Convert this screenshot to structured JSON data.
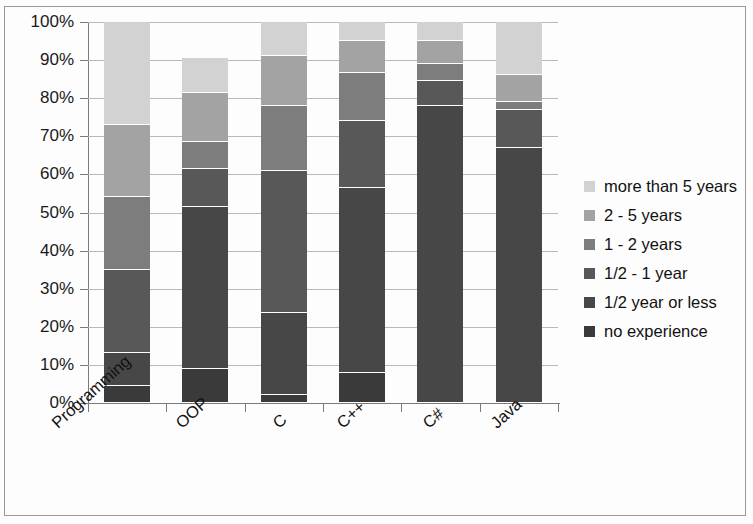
{
  "chart_data": {
    "type": "bar",
    "subtype": "stacked-100-percent",
    "title": "",
    "xlabel": "",
    "ylabel": "",
    "ylim": [
      0,
      100
    ],
    "ytick_labels": [
      "0%",
      "10%",
      "20%",
      "30%",
      "40%",
      "50%",
      "60%",
      "70%",
      "80%",
      "90%",
      "100%"
    ],
    "ytick_values": [
      0,
      10,
      20,
      30,
      40,
      50,
      60,
      70,
      80,
      90,
      100
    ],
    "grid": true,
    "legend_position": "right",
    "categories": [
      "Programming",
      "OOP",
      "C",
      "C++",
      "C#",
      "Java"
    ],
    "series": [
      {
        "name": "no experience",
        "color": "#3a3a3a",
        "values": [
          4.5,
          9,
          2,
          8,
          0,
          0
        ]
      },
      {
        "name": "1/2 year or less",
        "color": "#474747",
        "values": [
          8.5,
          42.5,
          21.5,
          48.5,
          78,
          67
        ]
      },
      {
        "name": "1/2 - 1 year",
        "color": "#585858",
        "values": [
          22,
          10,
          37.5,
          17.5,
          6.5,
          10
        ]
      },
      {
        "name": "1 - 2 years",
        "color": "#7d7d7d",
        "values": [
          19,
          7,
          17,
          12.5,
          4.5,
          2
        ]
      },
      {
        "name": "2 - 5 years",
        "color": "#a3a3a3",
        "values": [
          19,
          13,
          13,
          8.5,
          6,
          7
        ]
      },
      {
        "name": "more than 5 years",
        "color": "#d2d2d2",
        "values": [
          27,
          9,
          9,
          5,
          5,
          14
        ]
      }
    ]
  },
  "legend": {
    "items": [
      {
        "label": "more than 5 years",
        "color": "#d2d2d2"
      },
      {
        "label": "2 - 5 years",
        "color": "#a3a3a3"
      },
      {
        "label": "1 - 2 years",
        "color": "#7d7d7d"
      },
      {
        "label": "1/2 - 1 year",
        "color": "#585858"
      },
      {
        "label": "1/2 year or less",
        "color": "#474747"
      },
      {
        "label": "no experience",
        "color": "#3a3a3a"
      }
    ]
  }
}
